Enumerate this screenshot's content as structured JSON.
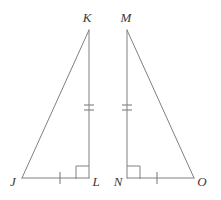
{
  "figure": {
    "type": "geometry-diagram",
    "stroke_color": "#808080",
    "label_color": "#3a3a3a",
    "background_color": "#ffffff",
    "canvas": {
      "width": 221,
      "height": 200
    },
    "triangles": [
      {
        "name": "triangle-jkl",
        "vertices": [
          {
            "label": "J",
            "x": 22,
            "y": 178,
            "label_x": 13,
            "label_y": 186
          },
          {
            "label": "K",
            "x": 89,
            "y": 30,
            "label_x": 87,
            "label_y": 22
          },
          {
            "label": "L",
            "x": 89,
            "y": 178,
            "label_x": 96,
            "label_y": 186
          }
        ],
        "right_angle_at": "L",
        "segments": [
          {
            "name": "segment-jk",
            "from": "J",
            "to": "K",
            "ticks": 0
          },
          {
            "name": "segment-kl",
            "from": "K",
            "to": "L",
            "ticks": 2
          },
          {
            "name": "segment-jl",
            "from": "J",
            "to": "L",
            "ticks": 1
          }
        ]
      },
      {
        "name": "triangle-mno",
        "vertices": [
          {
            "label": "M",
            "x": 127,
            "y": 30,
            "label_x": 126,
            "label_y": 22
          },
          {
            "label": "N",
            "x": 127,
            "y": 178,
            "label_x": 118,
            "label_y": 186
          },
          {
            "label": "O",
            "x": 194,
            "y": 178,
            "label_x": 202,
            "label_y": 186
          }
        ],
        "right_angle_at": "N",
        "segments": [
          {
            "name": "segment-mo",
            "from": "M",
            "to": "O",
            "ticks": 0
          },
          {
            "name": "segment-mn",
            "from": "M",
            "to": "N",
            "ticks": 2
          },
          {
            "name": "segment-no",
            "from": "N",
            "to": "O",
            "ticks": 1
          }
        ]
      }
    ],
    "right_angle_marks": [
      {
        "name": "right-angle-mark-l",
        "x": 76,
        "y": 166,
        "size": 13
      },
      {
        "name": "right-angle-mark-n",
        "x": 127,
        "y": 166,
        "size": 13
      }
    ],
    "tick_marks": [
      {
        "name": "tick-kl-upper",
        "orientation": "horizontal",
        "x1": 84,
        "y1": 105,
        "x2": 94,
        "y2": 105
      },
      {
        "name": "tick-kl-lower",
        "orientation": "horizontal",
        "x1": 84,
        "y1": 110,
        "x2": 94,
        "y2": 110
      },
      {
        "name": "tick-mn-upper",
        "orientation": "horizontal",
        "x1": 122,
        "y1": 105,
        "x2": 132,
        "y2": 105
      },
      {
        "name": "tick-mn-lower",
        "orientation": "horizontal",
        "x1": 122,
        "y1": 110,
        "x2": 132,
        "y2": 110
      },
      {
        "name": "tick-jl-single",
        "orientation": "vertical",
        "x1": 60,
        "y1": 172,
        "x2": 60,
        "y2": 184
      },
      {
        "name": "tick-no-single",
        "orientation": "vertical",
        "x1": 157,
        "y1": 172,
        "x2": 157,
        "y2": 184
      }
    ],
    "labels": {
      "k": "K",
      "m": "M",
      "j": "J",
      "l": "L",
      "n": "N",
      "o": "O"
    }
  }
}
